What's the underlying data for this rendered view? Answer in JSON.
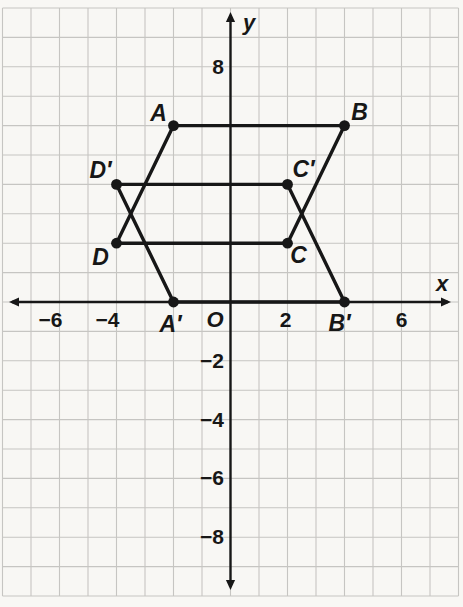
{
  "figure": {
    "plane": {
      "background": "#f8f7f4",
      "grid_color": "#c6c5c2",
      "ink_color": "#171717",
      "origin_px": [
        230.5,
        302
      ],
      "unit_px": [
        28.5,
        29.4
      ],
      "x_range": [
        -8,
        8
      ],
      "y_range": [
        -10,
        10
      ]
    },
    "axes": {
      "x": {
        "label": "x",
        "label_pos_px": [
          442,
          291
        ],
        "tip_start_px": 9,
        "tip_end_px": 451,
        "tick_baseline_px": 327,
        "ticks": [
          {
            "text": "−6",
            "value": -6,
            "dx": -9
          },
          {
            "text": "−4",
            "value": -4,
            "dx": -9
          },
          {
            "text": "2",
            "value": 2,
            "dx": -2
          },
          {
            "text": "6",
            "value": 6,
            "dx": 0
          }
        ]
      },
      "y": {
        "label": "y",
        "label_pos_px": [
          243,
          30
        ],
        "tip_start_px": 12,
        "tip_end_px": 590,
        "tick_right_px": 224,
        "tick_baseline_offset": 7,
        "ticks": [
          {
            "text": "8",
            "value": 8
          },
          {
            "text": "−2",
            "value": -2
          },
          {
            "text": "−4",
            "value": -4
          },
          {
            "text": "−6",
            "value": -6
          },
          {
            "text": "−8",
            "value": -8
          }
        ]
      },
      "origin": {
        "text": "O",
        "pos_px": [
          215,
          327
        ]
      }
    },
    "points": [
      {
        "label": "A",
        "x": -2,
        "y": 6,
        "label_offset": [
          -15,
          -5
        ]
      },
      {
        "label": "B",
        "x": 4,
        "y": 6,
        "label_offset": [
          15,
          -6
        ]
      },
      {
        "label": "C",
        "x": 2,
        "y": 2,
        "label_offset": [
          11,
          20
        ]
      },
      {
        "label": "D",
        "x": -4,
        "y": 2,
        "label_offset": [
          -16,
          22
        ]
      },
      {
        "label": "A′",
        "x": -2,
        "y": 0,
        "label_offset": [
          -3,
          30
        ]
      },
      {
        "label": "B′",
        "x": 4,
        "y": 0,
        "label_offset": [
          -5,
          29
        ]
      },
      {
        "label": "C′",
        "x": 2,
        "y": 4,
        "label_offset": [
          16,
          -7
        ]
      },
      {
        "label": "D′",
        "x": -4,
        "y": 4,
        "label_offset": [
          -16,
          -6
        ]
      }
    ],
    "shapes": [
      {
        "name": "parallelogram-ABCD",
        "vertices": [
          "A",
          "B",
          "C",
          "D"
        ]
      },
      {
        "name": "parallelogram-A'B'C'D'",
        "vertices": [
          "A′",
          "B′",
          "C′",
          "D′"
        ]
      }
    ],
    "style": {
      "shape_stroke_width": 3.4,
      "axis_stroke_width": 2.4,
      "grid_stroke_width": 1.1,
      "point_radius": 5.4,
      "point_label_font_px": 23,
      "tick_font_px": 21,
      "axis_letter_font_px": 22
    }
  }
}
